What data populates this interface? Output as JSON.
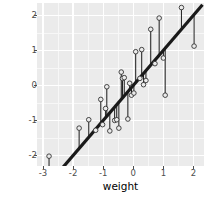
{
  "chart_data": {
    "type": "scatter",
    "title": "",
    "xlabel": "weight",
    "ylabel": "disc",
    "xlim": [
      -3.2,
      2.35
    ],
    "ylim": [
      -2.3,
      2.35
    ],
    "xticks": [
      -3,
      -2,
      -1,
      0,
      1,
      2
    ],
    "yticks": [
      -2,
      -1,
      0,
      1,
      2
    ],
    "xticklabels": [
      "-3",
      "-2",
      "-1",
      "0",
      "1",
      "2"
    ],
    "yticklabels": [
      "-2",
      "-1",
      "0",
      "1",
      "2"
    ],
    "grid": true,
    "grid_major": true,
    "grid_minor": true,
    "legend": "none",
    "panel_background": "#ebebeb",
    "grid_color": "#ffffff",
    "point_color": "#333333",
    "point_fill": "#ebebeb",
    "line_color": "#1a1a1a",
    "residual_color": "#1a1a1a",
    "fit_line": {
      "type": "linear",
      "slope": 1.0,
      "intercept": 0.0,
      "x_start": -2.55,
      "x_end": 2.3,
      "y_start": -2.55,
      "y_end": 2.3,
      "width": 3.2
    },
    "series": [
      {
        "name": "observations",
        "points": [
          {
            "x": -2.8,
            "y": -2.02,
            "fit": -2.8
          },
          {
            "x": -1.8,
            "y": -1.22,
            "fit": -1.8
          },
          {
            "x": -1.48,
            "y": -0.98,
            "fit": -1.48
          },
          {
            "x": -1.25,
            "y": -1.28,
            "fit": -1.25
          },
          {
            "x": -1.08,
            "y": -0.4,
            "fit": -1.08
          },
          {
            "x": -1.02,
            "y": -1.12,
            "fit": -1.02
          },
          {
            "x": -0.92,
            "y": -0.66,
            "fit": -0.92
          },
          {
            "x": -0.88,
            "y": -0.04,
            "fit": -0.88
          },
          {
            "x": -0.78,
            "y": -1.3,
            "fit": -0.78
          },
          {
            "x": -0.62,
            "y": -1.0,
            "fit": -0.62
          },
          {
            "x": -0.55,
            "y": -0.98,
            "fit": -0.55
          },
          {
            "x": -0.48,
            "y": -1.22,
            "fit": -0.48
          },
          {
            "x": -0.4,
            "y": 0.38,
            "fit": -0.4
          },
          {
            "x": -0.36,
            "y": 0.2,
            "fit": -0.36
          },
          {
            "x": -0.3,
            "y": 0.22,
            "fit": -0.3
          },
          {
            "x": -0.18,
            "y": -0.96,
            "fit": -0.18
          },
          {
            "x": -0.12,
            "y": 0.06,
            "fit": -0.12
          },
          {
            "x": -0.06,
            "y": -0.28,
            "fit": -0.06
          },
          {
            "x": 0.02,
            "y": -0.22,
            "fit": 0.02
          },
          {
            "x": 0.08,
            "y": 0.96,
            "fit": 0.08
          },
          {
            "x": 0.22,
            "y": 0.2,
            "fit": 0.22
          },
          {
            "x": 0.28,
            "y": 1.02,
            "fit": 0.28
          },
          {
            "x": 0.34,
            "y": 0.02,
            "fit": 0.34
          },
          {
            "x": 0.42,
            "y": 0.14,
            "fit": 0.42
          },
          {
            "x": 0.58,
            "y": 1.6,
            "fit": 0.58
          },
          {
            "x": 0.72,
            "y": 0.62,
            "fit": 0.72
          },
          {
            "x": 0.86,
            "y": 1.92,
            "fit": 0.86
          },
          {
            "x": 1.0,
            "y": 0.78,
            "fit": 1.0
          },
          {
            "x": 1.06,
            "y": -0.28,
            "fit": 1.06
          },
          {
            "x": 1.6,
            "y": 2.22,
            "fit": 1.6
          },
          {
            "x": 2.02,
            "y": 1.12,
            "fit": 2.02
          }
        ]
      }
    ],
    "residual_segments": [
      {
        "x": -2.8,
        "y_obs": -2.02,
        "y_fit": -2.8
      },
      {
        "x": -1.8,
        "y_obs": -1.22,
        "y_fit": -1.8
      },
      {
        "x": -1.48,
        "y_obs": -0.98,
        "y_fit": -1.48
      },
      {
        "x": -1.25,
        "y_obs": -1.28,
        "y_fit": -1.25
      },
      {
        "x": -1.08,
        "y_obs": -0.4,
        "y_fit": -1.08
      },
      {
        "x": -1.02,
        "y_obs": -1.12,
        "y_fit": -1.02
      },
      {
        "x": -0.92,
        "y_obs": -0.66,
        "y_fit": -0.92
      },
      {
        "x": -0.88,
        "y_obs": -0.04,
        "y_fit": -0.88
      },
      {
        "x": -0.78,
        "y_obs": -1.3,
        "y_fit": -0.78
      },
      {
        "x": -0.62,
        "y_obs": -1.0,
        "y_fit": -0.62
      },
      {
        "x": -0.55,
        "y_obs": -0.98,
        "y_fit": -0.55
      },
      {
        "x": -0.48,
        "y_obs": -1.22,
        "y_fit": -0.48
      },
      {
        "x": -0.4,
        "y_obs": 0.38,
        "y_fit": -0.4
      },
      {
        "x": -0.36,
        "y_obs": 0.2,
        "y_fit": -0.36
      },
      {
        "x": -0.3,
        "y_obs": 0.22,
        "y_fit": -0.3
      },
      {
        "x": -0.18,
        "y_obs": -0.96,
        "y_fit": -0.18
      },
      {
        "x": -0.12,
        "y_obs": 0.06,
        "y_fit": -0.12
      },
      {
        "x": -0.06,
        "y_obs": -0.28,
        "y_fit": -0.06
      },
      {
        "x": 0.02,
        "y_obs": -0.22,
        "y_fit": 0.02
      },
      {
        "x": 0.08,
        "y_obs": 0.96,
        "y_fit": 0.08
      },
      {
        "x": 0.22,
        "y_obs": 0.2,
        "y_fit": 0.22
      },
      {
        "x": 0.28,
        "y_obs": 1.02,
        "y_fit": 0.28
      },
      {
        "x": 0.34,
        "y_obs": 0.02,
        "y_fit": 0.34
      },
      {
        "x": 0.42,
        "y_obs": 0.14,
        "y_fit": 0.42
      },
      {
        "x": 0.58,
        "y_obs": 1.6,
        "y_fit": 0.58
      },
      {
        "x": 0.72,
        "y_obs": 0.62,
        "y_fit": 0.72
      },
      {
        "x": 0.86,
        "y_obs": 1.92,
        "y_fit": 0.86
      },
      {
        "x": 1.0,
        "y_obs": 0.78,
        "y_fit": 1.0
      },
      {
        "x": 1.06,
        "y_obs": -0.28,
        "y_fit": 1.06
      },
      {
        "x": 1.6,
        "y_obs": 2.22,
        "y_fit": 1.6
      },
      {
        "x": 2.02,
        "y_obs": 1.12,
        "y_fit": 2.02
      }
    ],
    "minor_xticks": [
      -2.5,
      -1.5,
      -0.5,
      0.5,
      1.5
    ],
    "minor_yticks": [
      -1.5,
      -0.5,
      0.5,
      1.5
    ]
  }
}
